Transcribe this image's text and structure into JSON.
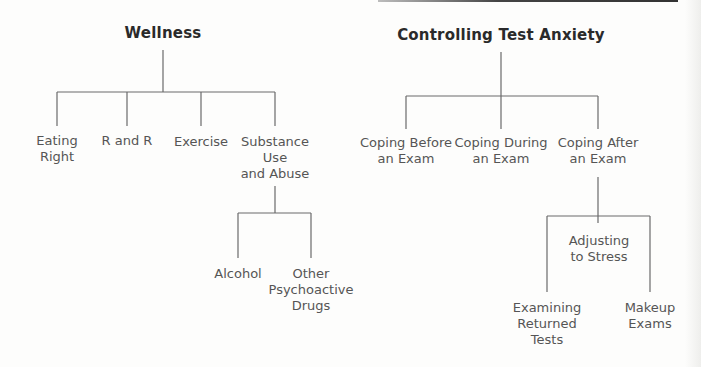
{
  "diagrams": [
    {
      "title": "Wellness",
      "children": [
        {
          "label": "Eating\nRight"
        },
        {
          "label": "R and R"
        },
        {
          "label": "Exercise"
        },
        {
          "label": "Substance\nUse\nand Abuse",
          "children": [
            {
              "label": "Alcohol"
            },
            {
              "label": "Other\nPsychoactive\nDrugs"
            }
          ]
        }
      ]
    },
    {
      "title": "Controlling Test Anxiety",
      "children": [
        {
          "label": "Coping Before\nan Exam"
        },
        {
          "label": "Coping During\nan Exam"
        },
        {
          "label": "Coping After\nan Exam",
          "center_label": "Adjusting\nto Stress",
          "children": [
            {
              "label": "Examining\nReturned\nTests"
            },
            {
              "label": "Makeup\nExams"
            }
          ]
        }
      ]
    }
  ],
  "colors": {
    "lines": "#6a6a6a",
    "text": "#555555",
    "title": "#2a2a2a"
  }
}
